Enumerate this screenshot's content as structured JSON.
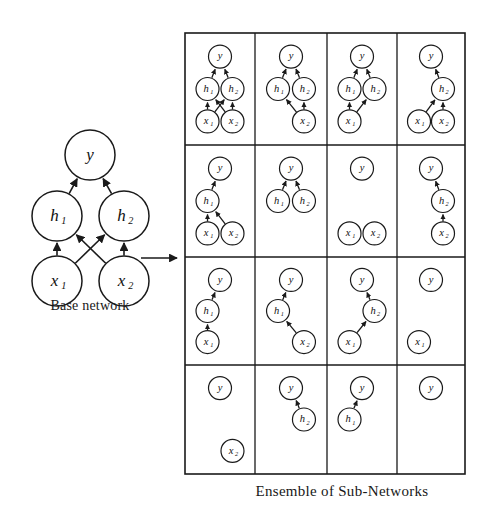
{
  "figure": {
    "base_caption": "Base network",
    "ensemble_caption": "Ensemble of Sub-Networks",
    "transform_arrow": "right-arrow"
  },
  "labels": {
    "y": "y",
    "h1": "h",
    "h1_sub": "1",
    "h2": "h",
    "h2_sub": "2",
    "x1": "x",
    "x1_sub": "1",
    "x2": "x",
    "x2_sub": "2"
  },
  "colors": {
    "stroke": "#1a1a1a",
    "fill": "#ffffff",
    "background": "#ffffff",
    "grid_border": "#1a1a1a"
  },
  "base_network": {
    "name": "Base network",
    "nodes": [
      {
        "id": "y",
        "label": "y",
        "sub": "",
        "x": 90,
        "y": 155,
        "r": 25
      },
      {
        "id": "h1",
        "label": "h",
        "sub": "1",
        "x": 57,
        "y": 216,
        "r": 25
      },
      {
        "id": "h2",
        "label": "h",
        "sub": "2",
        "x": 124,
        "y": 216,
        "r": 25
      },
      {
        "id": "x1",
        "label": "x",
        "sub": "1",
        "x": 57,
        "y": 281,
        "r": 25
      },
      {
        "id": "x2",
        "label": "x",
        "sub": "2",
        "x": 124,
        "y": 281,
        "r": 25
      }
    ],
    "edges": [
      {
        "from": "h1",
        "to": "y"
      },
      {
        "from": "h2",
        "to": "y"
      },
      {
        "from": "x1",
        "to": "h1"
      },
      {
        "from": "x1",
        "to": "h2"
      },
      {
        "from": "x2",
        "to": "h1"
      },
      {
        "from": "x2",
        "to": "h2"
      }
    ]
  },
  "grid": {
    "left": 185,
    "top": 33,
    "right": 465,
    "bottom": 474,
    "rows": 4,
    "cols": 4,
    "col_edges": [
      185,
      255,
      327,
      397,
      465
    ],
    "row_edges": [
      33,
      145,
      257,
      365,
      474
    ]
  },
  "subnetworks": [
    {
      "index": 1,
      "row": 1,
      "col": 1,
      "nodes": [
        "y",
        "h1",
        "h2",
        "x1",
        "x2"
      ],
      "edges": [
        [
          "h1",
          "y"
        ],
        [
          "h2",
          "y"
        ],
        [
          "x1",
          "h1"
        ],
        [
          "x1",
          "h2"
        ],
        [
          "x2",
          "h1"
        ],
        [
          "x2",
          "h2"
        ]
      ]
    },
    {
      "index": 2,
      "row": 1,
      "col": 2,
      "nodes": [
        "y",
        "h1",
        "h2",
        "x2"
      ],
      "edges": [
        [
          "h1",
          "y"
        ],
        [
          "h2",
          "y"
        ],
        [
          "x2",
          "h1"
        ],
        [
          "x2",
          "h2"
        ]
      ]
    },
    {
      "index": 3,
      "row": 1,
      "col": 3,
      "nodes": [
        "y",
        "h1",
        "h2",
        "x1"
      ],
      "edges": [
        [
          "h1",
          "y"
        ],
        [
          "h2",
          "y"
        ],
        [
          "x1",
          "h1"
        ],
        [
          "x1",
          "h2"
        ]
      ]
    },
    {
      "index": 4,
      "row": 1,
      "col": 4,
      "nodes": [
        "y",
        "h2",
        "x1",
        "x2"
      ],
      "edges": [
        [
          "h2",
          "y"
        ],
        [
          "x1",
          "h2"
        ],
        [
          "x2",
          "h2"
        ]
      ]
    },
    {
      "index": 5,
      "row": 2,
      "col": 1,
      "nodes": [
        "y",
        "h1",
        "x1",
        "x2"
      ],
      "edges": [
        [
          "h1",
          "y"
        ],
        [
          "x1",
          "h1"
        ],
        [
          "x2",
          "h1"
        ]
      ]
    },
    {
      "index": 6,
      "row": 2,
      "col": 2,
      "nodes": [
        "y",
        "h1",
        "h2"
      ],
      "edges": [
        [
          "h1",
          "y"
        ],
        [
          "h2",
          "y"
        ]
      ]
    },
    {
      "index": 7,
      "row": 2,
      "col": 3,
      "nodes": [
        "y",
        "x1",
        "x2"
      ],
      "edges": []
    },
    {
      "index": 8,
      "row": 2,
      "col": 4,
      "nodes": [
        "y",
        "h2",
        "x2"
      ],
      "edges": [
        [
          "h2",
          "y"
        ],
        [
          "x2",
          "h2"
        ]
      ]
    },
    {
      "index": 9,
      "row": 3,
      "col": 1,
      "nodes": [
        "y",
        "h1",
        "x1"
      ],
      "edges": [
        [
          "h1",
          "y"
        ],
        [
          "x1",
          "h1"
        ]
      ]
    },
    {
      "index": 10,
      "row": 3,
      "col": 2,
      "nodes": [
        "y",
        "h1",
        "x2"
      ],
      "edges": [
        [
          "h1",
          "y"
        ],
        [
          "x2",
          "h1"
        ]
      ]
    },
    {
      "index": 11,
      "row": 3,
      "col": 3,
      "nodes": [
        "y",
        "h2",
        "x1"
      ],
      "edges": [
        [
          "h2",
          "y"
        ],
        [
          "x1",
          "h2"
        ]
      ]
    },
    {
      "index": 12,
      "row": 3,
      "col": 4,
      "nodes": [
        "y",
        "x1"
      ],
      "edges": []
    },
    {
      "index": 13,
      "row": 4,
      "col": 1,
      "nodes": [
        "y",
        "x2"
      ],
      "edges": []
    },
    {
      "index": 14,
      "row": 4,
      "col": 2,
      "nodes": [
        "y",
        "h2"
      ],
      "edges": [
        [
          "h2",
          "y"
        ]
      ]
    },
    {
      "index": 15,
      "row": 4,
      "col": 3,
      "nodes": [
        "y",
        "h1"
      ],
      "edges": [
        [
          "h1",
          "y"
        ]
      ]
    },
    {
      "index": 16,
      "row": 4,
      "col": 4,
      "nodes": [
        "y"
      ],
      "edges": []
    }
  ]
}
